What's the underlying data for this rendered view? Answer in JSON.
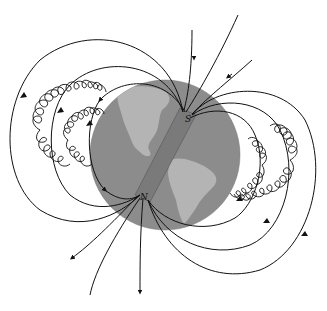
{
  "diagram": {
    "labels": {
      "south_pole": "S",
      "north_pole": "N"
    },
    "colors": {
      "background": "#ffffff",
      "ocean": "#8c8c8c",
      "land": "#b4b4b4",
      "magnet": "#7a7a7a",
      "lines": "#111111"
    }
  }
}
